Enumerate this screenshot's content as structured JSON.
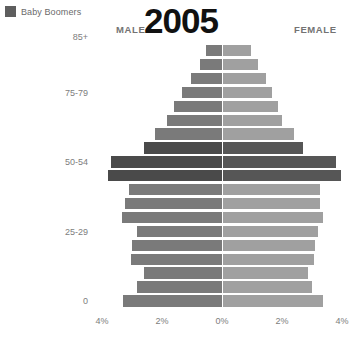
{
  "legend": {
    "label": "Baby Boomers",
    "swatch_color": "#5e5e5e",
    "swatch_icon": "legend-square-icon"
  },
  "header": {
    "male_label": "MALE",
    "female_label": "FEMALE",
    "year_title": "2005"
  },
  "axis": {
    "x_ticks": [
      "4%",
      "2%",
      "0%",
      "2%",
      "4%"
    ],
    "x_tick_values": [
      -4,
      -2,
      0,
      2,
      4
    ],
    "y_visible_labels": [
      "85+",
      "75-79",
      "50-54",
      "25-29",
      "0"
    ]
  },
  "colors": {
    "male": "#7a7a7a",
    "female": "#a0a0a0",
    "male_boomer": "#4a4a4a",
    "female_boomer": "#565656",
    "background": "#ffffff",
    "text": "#7d7d7d",
    "title": "#111111"
  },
  "chart_data": {
    "type": "bar",
    "subtype": "population-pyramid",
    "title": "2005",
    "xlabel": "",
    "ylabel": "",
    "xlim": [
      -4,
      4
    ],
    "grid": false,
    "legend_position": "top-left",
    "annotations": [
      "MALE",
      "FEMALE"
    ],
    "categories": [
      "90+",
      "85-89",
      "80-84",
      "75-79",
      "70-74",
      "65-69",
      "60-64",
      "55-59",
      "50-54",
      "45-49",
      "40-44",
      "35-39",
      "30-34",
      "25-29",
      "20-24",
      "15-19",
      "10-14",
      "5-9",
      "0-4"
    ],
    "highlight_categories": [
      "55-59",
      "50-54",
      "45-49"
    ],
    "series": [
      {
        "name": "Male",
        "side": "left",
        "values": [
          0.55,
          0.75,
          1.05,
          1.35,
          1.6,
          1.85,
          2.25,
          2.6,
          3.7,
          3.8,
          3.1,
          3.25,
          3.35,
          2.85,
          3.0,
          3.05,
          2.6,
          2.85,
          3.3
        ]
      },
      {
        "name": "Female",
        "side": "right",
        "values": [
          0.95,
          1.2,
          1.45,
          1.65,
          1.85,
          2.0,
          2.4,
          2.7,
          3.8,
          3.95,
          3.25,
          3.25,
          3.35,
          3.2,
          3.1,
          3.05,
          2.85,
          3.0,
          3.35
        ]
      }
    ],
    "units": "percent of total population"
  }
}
